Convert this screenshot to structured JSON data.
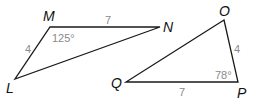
{
  "triangles": [
    {
      "name": "LMN",
      "vertices": [
        {
          "label": "M",
          "x": 50,
          "y": 27,
          "lx": 43,
          "ly": 21
        },
        {
          "label": "N",
          "x": 160,
          "y": 27,
          "lx": 163,
          "ly": 32
        },
        {
          "label": "L",
          "x": 15,
          "y": 79,
          "lx": 6,
          "ly": 93
        }
      ],
      "side_labels": [
        {
          "text": "7",
          "x": 105,
          "y": 24,
          "for": "MN"
        },
        {
          "text": "4",
          "x": 25,
          "y": 53,
          "for": "LM"
        }
      ],
      "angle_labels": [
        {
          "text": "125°",
          "x": 52,
          "y": 42,
          "at": "M"
        }
      ]
    },
    {
      "name": "OPQ",
      "vertices": [
        {
          "label": "O",
          "x": 224,
          "y": 20,
          "lx": 219,
          "ly": 16
        },
        {
          "label": "P",
          "x": 238,
          "y": 82,
          "lx": 237,
          "ly": 98
        },
        {
          "label": "Q",
          "x": 126,
          "y": 82,
          "lx": 111,
          "ly": 88
        }
      ],
      "side_labels": [
        {
          "text": "4",
          "x": 234,
          "y": 53,
          "for": "OP"
        },
        {
          "text": "7",
          "x": 179,
          "y": 96,
          "for": "QP"
        }
      ],
      "angle_labels": [
        {
          "text": "78°",
          "x": 215,
          "y": 79,
          "at": "P"
        }
      ]
    }
  ],
  "colors": {
    "edge": "#1a1a1a",
    "vertex_label": "#111111",
    "measure_label": "#8a8a8a"
  }
}
